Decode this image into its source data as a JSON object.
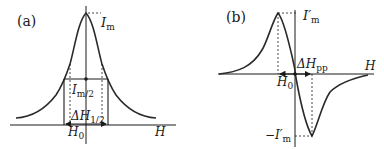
{
  "panels": [
    {
      "id": "a",
      "label": "(a)",
      "curve_type": "absorption (Lorentzian line)",
      "x_axis_label": "H",
      "labels": {
        "peak": "I",
        "peak_sub": "m",
        "half": "I",
        "half_sub": "m/2",
        "width": "ΔH",
        "width_sub": "1/2",
        "center": "H",
        "center_sub": "0"
      }
    },
    {
      "id": "b",
      "label": "(b)",
      "curve_type": "first-derivative line",
      "x_axis_label": "H",
      "labels": {
        "max": "I′",
        "max_sub": "m",
        "min": "−I′",
        "min_sub": "m",
        "width": "ΔH",
        "width_sub": "pp",
        "center": "H",
        "center_sub": "0"
      }
    }
  ],
  "colors": {
    "ink": "#1a1a1a",
    "curve": "#2a2a2a",
    "background": "#ffffff"
  }
}
